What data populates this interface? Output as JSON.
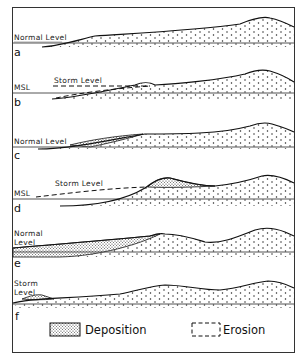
{
  "figure": {
    "frame_color": "#333333",
    "background": "#ffffff",
    "ink": "#111111",
    "panels": [
      {
        "id": "a",
        "letter": "a",
        "level_label": "Normal Level",
        "level_label_lines": [
          "Normal Level"
        ],
        "level_type": "normal"
      },
      {
        "id": "b",
        "letter": "b",
        "level_label": "MSL",
        "storm_label": "Storm Level",
        "level_type": "storm"
      },
      {
        "id": "c",
        "letter": "c",
        "level_label": "Normal Level",
        "level_type": "normal"
      },
      {
        "id": "d",
        "letter": "d",
        "level_label": "MSL",
        "storm_label": "Storm Level",
        "level_type": "storm"
      },
      {
        "id": "e",
        "letter": "e",
        "level_label_lines": [
          "Normal",
          "Level"
        ],
        "level_type": "normal"
      },
      {
        "id": "f",
        "letter": "f",
        "level_label_lines": [
          "Storm",
          "Level"
        ],
        "level_type": "storm"
      }
    ],
    "legend": {
      "deposition_label": "Deposition",
      "erosion_label": "Erosion"
    }
  }
}
